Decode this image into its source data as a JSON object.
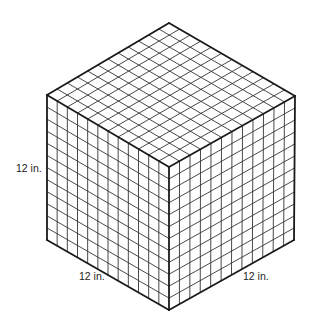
{
  "figure": {
    "type": "isometric-cube-grid",
    "divisions": 12,
    "vertices": {
      "top": [
        169,
        23
      ],
      "left_top": [
        47,
        95
      ],
      "right_top": [
        295,
        96
      ],
      "front_top": [
        169,
        167
      ],
      "left_bottom": [
        47,
        240
      ],
      "right_bottom": [
        294,
        240
      ],
      "front_bottom": [
        169,
        310
      ]
    },
    "colors": {
      "line": "#1a1a1a",
      "grid": "#333333",
      "background": "#ffffff"
    }
  },
  "labels": {
    "height": "12 in.",
    "depth": "12 in.",
    "width": "12 in."
  }
}
